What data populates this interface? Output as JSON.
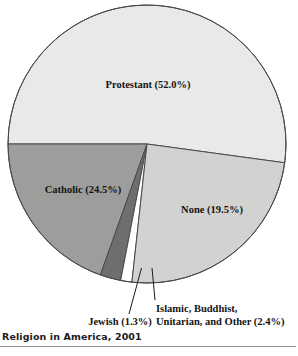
{
  "figure": {
    "caption": "Religion in America, 2001"
  },
  "chart_data": {
    "type": "pie",
    "title": "Religion in America, 2001",
    "xlabel": "",
    "ylabel": "",
    "legend_position": "none",
    "grid": false,
    "units": "percent",
    "categories": [
      "Protestant",
      "Catholic",
      "Jewish",
      "Islamic, Buddhist, Unitarian, and Other",
      "None"
    ],
    "values": [
      52.0,
      24.5,
      1.3,
      2.4,
      19.5
    ],
    "slices": [
      {
        "name": "Protestant",
        "value": 52.0,
        "label": "Protestant (52.0%)",
        "color": "#e9e9e7",
        "label_placement": "inside"
      },
      {
        "name": "Catholic",
        "value": 24.5,
        "label": "Catholic (24.5%)",
        "color": "#d2d2d0",
        "label_placement": "inside"
      },
      {
        "name": "Jewish",
        "value": 1.3,
        "label": "Jewish (1.3%)",
        "color": "#ffffff",
        "label_placement": "callout"
      },
      {
        "name": "Islamic, Buddhist, Unitarian, and Other",
        "value": 2.4,
        "label_line_1": "Islamic, Buddhist,",
        "label_line_2": "Unitarian, and Other (2.4%)",
        "color": "#6e6e6e",
        "label_placement": "callout"
      },
      {
        "name": "None",
        "value": 19.5,
        "label": "None (19.5%)",
        "color": "#9d9d9b",
        "label_placement": "inside"
      }
    ],
    "colors": {
      "protestant": "#e9e9e7",
      "catholic": "#d2d2d0",
      "jewish": "#ffffff",
      "other": "#6e6e6e",
      "none": "#9d9d9b",
      "outline": "#4a4a4a",
      "text": "#141414"
    }
  }
}
